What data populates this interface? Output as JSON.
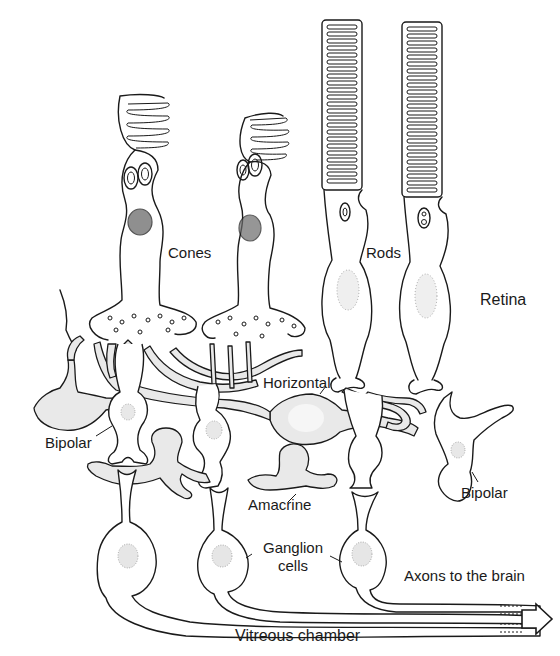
{
  "figure": {
    "title": "Retina",
    "background": "#ffffff",
    "ink_color": "#1a1a1a"
  },
  "labels": {
    "cones": "Cones",
    "rods": "Rods",
    "retina": "Retina",
    "horizontal": "Horizontal",
    "bipolar_left": "Bipolar",
    "bipolar_right": "Bipolar",
    "amacrine": "Amacrine",
    "ganglion_line1": "Ganglion",
    "ganglion_line2": "cells",
    "axons": "Axons to the brain",
    "vitreous": "Vitreous chamber"
  },
  "structures": [
    {
      "name": "cone-cell",
      "count": 2
    },
    {
      "name": "rod-cell",
      "count": 2
    },
    {
      "name": "horizontal-cell",
      "count": 2
    },
    {
      "name": "bipolar-cell",
      "count": 3
    },
    {
      "name": "amacrine-cell",
      "count": 2
    },
    {
      "name": "ganglion-cell",
      "count": 3
    },
    {
      "name": "axon-bundle",
      "count": 1
    }
  ]
}
